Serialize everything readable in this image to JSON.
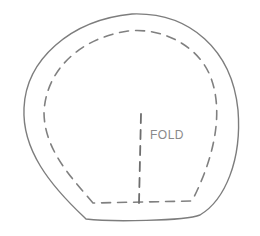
{
  "diagram": {
    "type": "sewing-pattern-piece",
    "labels": {
      "fold": "FOLD"
    },
    "elements": [
      {
        "name": "cutting-outline",
        "style": "solid"
      },
      {
        "name": "seam-allowance-line",
        "style": "dashed"
      },
      {
        "name": "fold-line",
        "style": "dashed",
        "orientation": "vertical"
      }
    ],
    "colors": {
      "background": "#ffffff",
      "line": "#7d7d7d",
      "text": "#8a8a8a"
    }
  }
}
